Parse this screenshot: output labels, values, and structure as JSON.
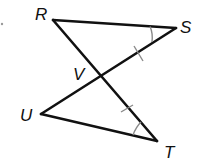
{
  "diagram": {
    "type": "geometry",
    "points": {
      "R": {
        "label": "R",
        "x": 53,
        "y": 20
      },
      "S": {
        "label": "S",
        "x": 176,
        "y": 28
      },
      "V": {
        "label": "V",
        "x": 99,
        "y": 73
      },
      "U": {
        "label": "U",
        "x": 41,
        "y": 114
      },
      "T": {
        "label": "T",
        "x": 157,
        "y": 141
      }
    },
    "segments": [
      "RS",
      "RT",
      "SU",
      "UT"
    ],
    "congruent_segments": [
      "SV",
      "VT"
    ],
    "congruent_angles": [
      "S",
      "T"
    ],
    "labels": {
      "R": "R",
      "S": "S",
      "V": "V",
      "U": "U",
      "T": "T"
    }
  }
}
